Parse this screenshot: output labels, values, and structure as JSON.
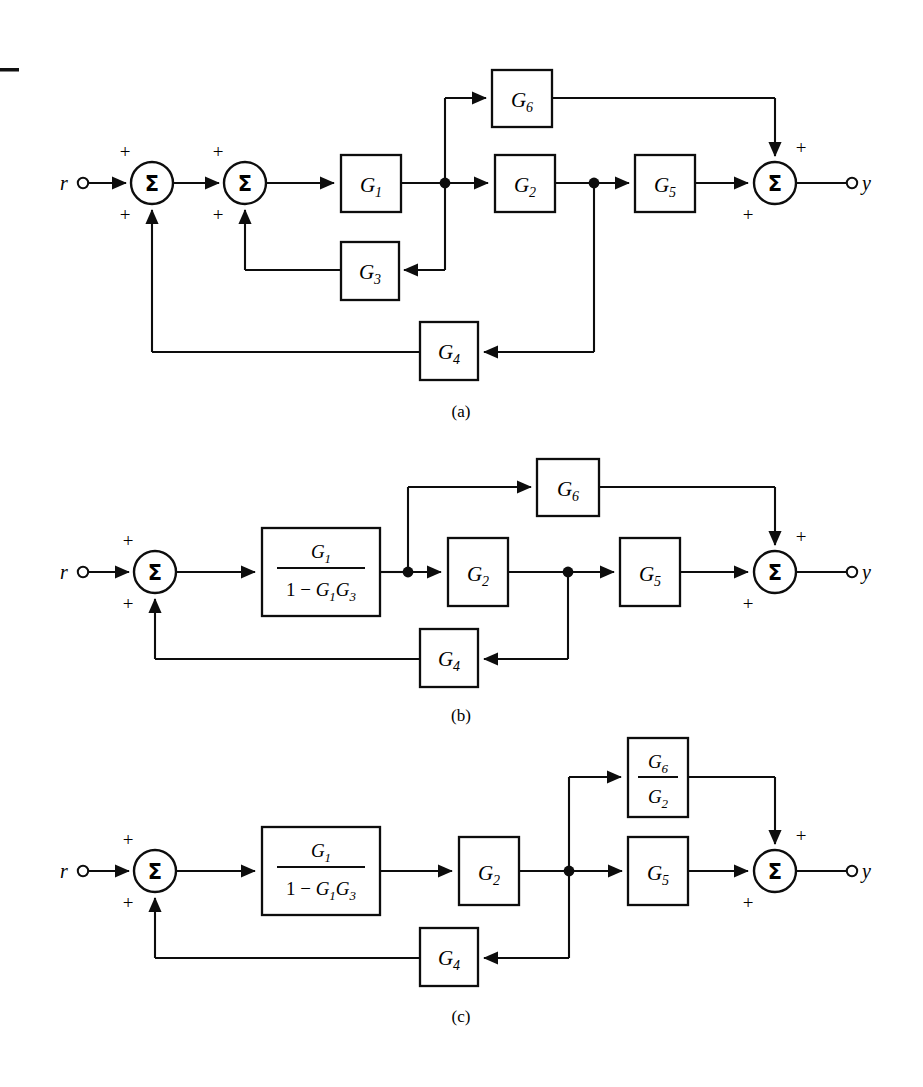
{
  "figure": {
    "page_rule": "—",
    "captions": [
      {
        "id": "caption-a",
        "text": "(a)"
      },
      {
        "id": "caption-b",
        "text": "(b)"
      },
      {
        "id": "caption-c",
        "text": "(c)"
      }
    ]
  },
  "symbols": {
    "input_label": "r",
    "output_label": "y",
    "summing_glyph": "Σ",
    "plus_sign": "+",
    "minus_sign": "−"
  },
  "diagram_a": {
    "caption": "(a)",
    "input": "r",
    "output": "y",
    "summers": [
      {
        "name": "summer-1",
        "glyph": "Σ",
        "signs": [
          "+",
          "+"
        ]
      },
      {
        "name": "summer-2",
        "glyph": "Σ",
        "signs": [
          "+",
          "+"
        ]
      },
      {
        "name": "summer-output",
        "glyph": "Σ",
        "signs": [
          "+",
          "+"
        ]
      }
    ],
    "blocks": [
      {
        "name": "block-g1",
        "base": "G",
        "sub": "1",
        "label": "G1"
      },
      {
        "name": "block-g2",
        "base": "G",
        "sub": "2",
        "label": "G2"
      },
      {
        "name": "block-g3",
        "base": "G",
        "sub": "3",
        "label": "G3"
      },
      {
        "name": "block-g4",
        "base": "G",
        "sub": "4",
        "label": "G4"
      },
      {
        "name": "block-g5",
        "base": "G",
        "sub": "5",
        "label": "G5"
      },
      {
        "name": "block-g6",
        "base": "G",
        "sub": "6",
        "label": "G6"
      }
    ]
  },
  "diagram_b": {
    "caption": "(b)",
    "input": "r",
    "output": "y",
    "summers": [
      {
        "name": "summer-1",
        "glyph": "Σ",
        "signs": [
          "+",
          "+"
        ]
      },
      {
        "name": "summer-output",
        "glyph": "Σ",
        "signs": [
          "+",
          "+"
        ]
      }
    ],
    "blocks": [
      {
        "name": "block-g1-over-1-minus-g1g3",
        "numerator": "G1",
        "denominator": "1 − G1G3",
        "label": "G1/(1-G1G3)"
      },
      {
        "name": "block-g2",
        "base": "G",
        "sub": "2",
        "label": "G2"
      },
      {
        "name": "block-g4",
        "base": "G",
        "sub": "4",
        "label": "G4"
      },
      {
        "name": "block-g5",
        "base": "G",
        "sub": "5",
        "label": "G5"
      },
      {
        "name": "block-g6",
        "base": "G",
        "sub": "6",
        "label": "G6"
      }
    ],
    "fraction": {
      "num_base": "G",
      "num_sub": "1",
      "den_one": "1",
      "den_op": "−",
      "den_g1_base": "G",
      "den_g1_sub": "1",
      "den_g3_base": "G",
      "den_g3_sub": "3"
    }
  },
  "diagram_c": {
    "caption": "(c)",
    "input": "r",
    "output": "y",
    "summers": [
      {
        "name": "summer-1",
        "glyph": "Σ",
        "signs": [
          "+",
          "+"
        ]
      },
      {
        "name": "summer-output",
        "glyph": "Σ",
        "signs": [
          "+",
          "+"
        ]
      }
    ],
    "blocks": [
      {
        "name": "block-g1-over-1-minus-g1g3",
        "numerator": "G1",
        "denominator": "1 − G1G3",
        "label": "G1/(1-G1G3)"
      },
      {
        "name": "block-g2",
        "base": "G",
        "sub": "2",
        "label": "G2"
      },
      {
        "name": "block-g4",
        "base": "G",
        "sub": "4",
        "label": "G4"
      },
      {
        "name": "block-g5",
        "base": "G",
        "sub": "5",
        "label": "G5"
      },
      {
        "name": "block-g6-over-g2",
        "numerator": "G6",
        "denominator": "G2",
        "label": "G6/G2"
      }
    ],
    "fraction_left": {
      "num_base": "G",
      "num_sub": "1",
      "den_one": "1",
      "den_op": "−",
      "den_g1_base": "G",
      "den_g1_sub": "1",
      "den_g3_base": "G",
      "den_g3_sub": "3"
    },
    "fraction_right": {
      "num_base": "G",
      "num_sub": "6",
      "den_base": "G",
      "den_sub": "2"
    }
  },
  "colors": {
    "ink": "#0d0d0d",
    "paper": "#ffffff"
  }
}
